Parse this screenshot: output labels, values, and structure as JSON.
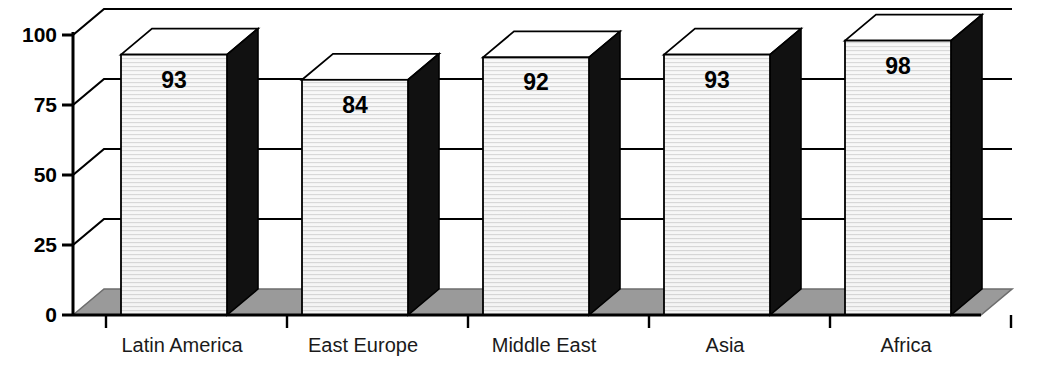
{
  "chart_data": {
    "type": "bar",
    "title": "",
    "subtitle": "",
    "xlabel": "",
    "ylabel": "",
    "categories": [
      "Latin America",
      "East Europe",
      "Middle East",
      "Asia",
      "Africa"
    ],
    "values": [
      93,
      84,
      92,
      93,
      98
    ],
    "value_labels": [
      "93",
      "84",
      "92",
      "93",
      "98"
    ],
    "ylim": [
      0,
      100
    ],
    "yticks": [
      0,
      25,
      50,
      75,
      100
    ],
    "ytick_labels": [
      "0",
      "25",
      "50",
      "75",
      "100"
    ],
    "grid": true,
    "grid_lines_at": [
      25,
      50,
      75,
      100
    ],
    "legend": null,
    "legend_position": "none",
    "style": "3d-column",
    "annotations": []
  },
  "axis": {
    "y_labels": [
      "100",
      "75",
      "50",
      "25",
      "0"
    ]
  },
  "colors": {
    "bar_front": "#f4f4f4",
    "bar_front_texture": "#d9d9d9",
    "bar_side": "#111111",
    "bar_top": "#ffffff",
    "bar_top_shade": "#8a8a8a",
    "floor": "#9a9a9a",
    "floor_edge": "#6d6d6d",
    "axis": "#000000",
    "grid": "#000000",
    "text": "#000000"
  }
}
